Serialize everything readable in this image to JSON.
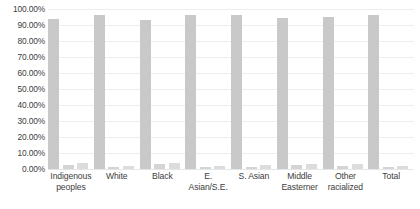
{
  "chart_data": {
    "type": "bar",
    "title": "",
    "xlabel": "",
    "ylabel": "",
    "ylim": [
      0,
      100
    ],
    "grid": true,
    "legend": "none",
    "ytick_labels": [
      "100.00%",
      "90.00%",
      "80.00%",
      "70.00%",
      "60.00%",
      "50.00%",
      "40.00%",
      "30.00%",
      "20.00%",
      "10.00%",
      "0.00%"
    ],
    "ytick_values": [
      100,
      90,
      80,
      70,
      60,
      50,
      40,
      30,
      20,
      10,
      0
    ],
    "categories": [
      "Indigenous peoples",
      "White",
      "Black",
      "E. Asian/S.E.",
      "S. Asian",
      "Middle Easterner",
      "Other racialized",
      "Total"
    ],
    "series": [
      {
        "name": "Series 1",
        "values": [
          93.5,
          96.5,
          93.0,
          96.5,
          96.0,
          94.5,
          95.0,
          96.5
        ]
      },
      {
        "name": "Series 2",
        "values": [
          2.5,
          1.5,
          3.0,
          1.5,
          1.5,
          2.5,
          2.0,
          1.5
        ]
      },
      {
        "name": "Series 3",
        "values": [
          4.0,
          2.0,
          4.0,
          2.0,
          2.5,
          3.0,
          3.0,
          2.0
        ]
      }
    ],
    "colors": {
      "series_1": "#c9c9c9",
      "series_2": "#d4d4d4",
      "series_3": "#dcdcdc",
      "gridline": "#eceef0",
      "text": "#3d3d3d",
      "background": "#ffffff"
    }
  }
}
